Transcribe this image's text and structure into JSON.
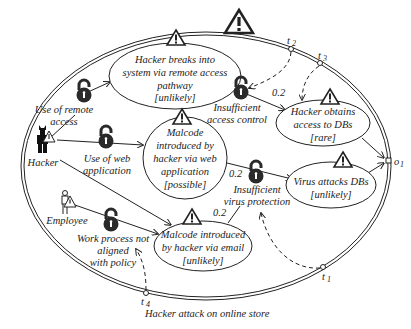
{
  "diagram": {
    "title": "Hacker attack on online store",
    "outer_gates": {
      "t1": "t",
      "t1_sub": "1",
      "t2": "t",
      "t2_sub": "2",
      "t3": "t",
      "t3_sub": "3",
      "t4": "t",
      "t4_sub": "4",
      "o1": "o",
      "o1_sub": "1"
    },
    "actors": {
      "hacker": "Hacker",
      "employee": "Employee"
    },
    "vulnerabilities": {
      "remote_access": [
        "Use of remote",
        "access"
      ],
      "web_application": [
        "Use of web",
        "application"
      ],
      "access_control": [
        "Insufficient",
        "access control"
      ],
      "virus_protection": [
        "Insufficient",
        "virus protection"
      ],
      "work_process": [
        "Work process not",
        "aligned",
        "with policy"
      ]
    },
    "threat_scenarios": {
      "breaks_into": [
        "Hacker breaks into",
        "system via remote access",
        "pathway",
        "[unlikely]"
      ],
      "malcode_web": [
        "Malcode",
        "introduced by",
        "hacker via web",
        "application",
        "[possible]"
      ],
      "obtains_access": [
        "Hacker obtains",
        "access to DBs",
        "[rare]"
      ],
      "virus_attacks": [
        "Virus attacks DBs",
        "[unlikely]"
      ],
      "malcode_email": [
        "Malcode introduced",
        "by hacker via email",
        "[unlikely]"
      ]
    },
    "conditional_likelihoods": {
      "access_control": "0.2",
      "virus_protection_web": "0.2",
      "virus_protection_email": "0.2"
    },
    "colors": {
      "stroke": "#222222",
      "lock_fill": "#2a2a2a",
      "background": "#ffffff"
    }
  }
}
